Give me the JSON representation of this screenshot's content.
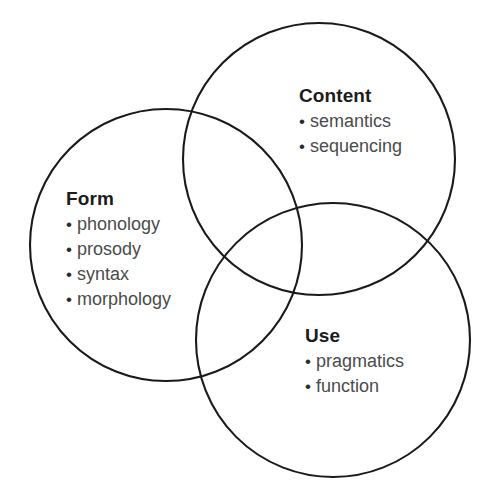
{
  "diagram": {
    "type": "venn",
    "background_color": "#ffffff",
    "stroke_color": "#1a1a1a",
    "stroke_width": 2.1,
    "heading_color": "#1c1c1c",
    "item_color": "#4b4b4b",
    "bullet_glyph": "•",
    "sets": [
      {
        "id": "form",
        "heading": "Form",
        "items": [
          "phonology",
          "prosody",
          "syntax",
          "morphology"
        ],
        "circle": {
          "cx": 166,
          "cy": 245,
          "r": 136
        }
      },
      {
        "id": "content",
        "heading": "Content",
        "items": [
          "semantics",
          "sequencing"
        ],
        "circle": {
          "cx": 319,
          "cy": 159,
          "r": 136
        }
      },
      {
        "id": "use",
        "heading": "Use",
        "items": [
          "pragmatics",
          "function"
        ],
        "circle": {
          "cx": 333,
          "cy": 340,
          "r": 137
        }
      }
    ]
  }
}
